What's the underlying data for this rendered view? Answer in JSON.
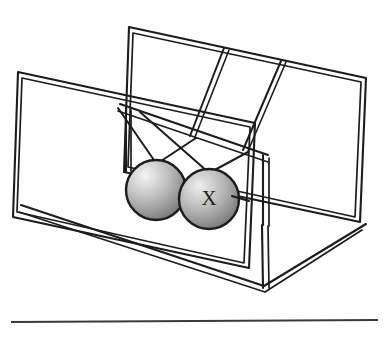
{
  "figure": {
    "canvas": {
      "width": 386,
      "height": 338,
      "background": "#ffffff"
    },
    "labels": {
      "ball_x": "X"
    },
    "colors": {
      "line": "#1c1c1c",
      "rule": "#3a3a3a",
      "ball_highlight": "#f2f2f2",
      "ball_mid": "#b4b4b4",
      "ball_shadow": "#6e6e6e",
      "background": "#ffffff"
    },
    "elements": {
      "stand_name": "wireframe-stand",
      "back_panel_name": "back-panel",
      "front_panel_name": "front-panel",
      "base_name": "base-frame",
      "left_ball_name": "pendulum-ball-left",
      "right_ball_name": "pendulum-ball-right",
      "rule_name": "horizontal-rule"
    },
    "geometry": {
      "left_ball": {
        "cx": 156,
        "cy": 190,
        "r": 30
      },
      "right_ball": {
        "cx": 209,
        "cy": 199,
        "r": 30
      },
      "rule": {
        "x1": 11,
        "y1": 322,
        "x2": 378,
        "y2": 320
      }
    },
    "suspension": {
      "wire_count": 4,
      "description": "Each ball hangs from a V-pair of wires attached to the top rails"
    }
  }
}
